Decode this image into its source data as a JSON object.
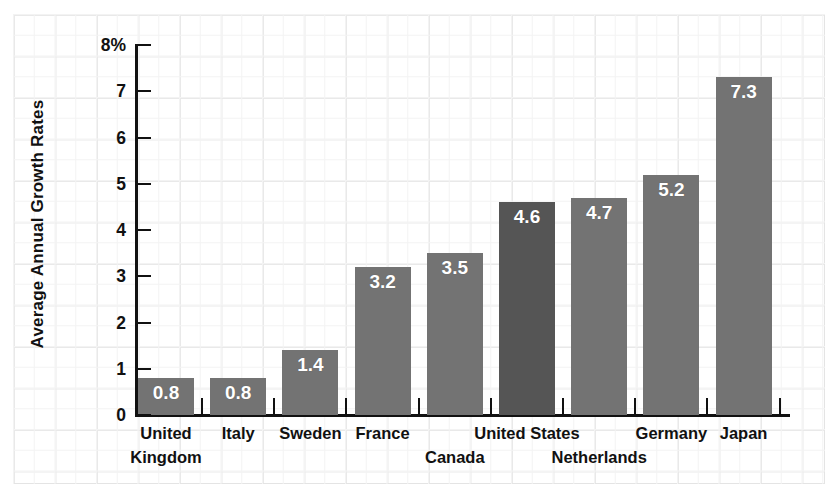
{
  "chart_data": {
    "type": "bar",
    "title": "",
    "subtitle": "",
    "xlabel": "",
    "ylabel": "Average Annual Growth Rates",
    "ylim": [
      0,
      8
    ],
    "yticks": [
      "0",
      "1",
      "2",
      "3",
      "4",
      "5",
      "6",
      "7",
      "8%"
    ],
    "ytick_values": [
      0,
      1,
      2,
      3,
      4,
      5,
      6,
      7,
      8
    ],
    "grid": true,
    "grid_style": "graph-paper",
    "legend": "none",
    "categories": [
      "United Kingdom",
      "Italy",
      "Sweden",
      "France",
      "Canada",
      "United States",
      "Netherlands",
      "Germany",
      "Japan"
    ],
    "values": [
      0.8,
      0.8,
      1.4,
      3.2,
      3.5,
      4.6,
      4.7,
      5.2,
      7.3
    ],
    "value_labels": [
      "0.8",
      "0.8",
      "1.4",
      "3.2",
      "3.5",
      "4.6",
      "4.7",
      "5.2",
      "7.3"
    ],
    "label_rows": [
      0,
      0,
      0,
      0,
      1,
      0,
      1,
      0,
      0
    ],
    "label_lines": [
      [
        "United",
        "Kingdom"
      ],
      [
        "Italy"
      ],
      [
        "Sweden"
      ],
      [
        "France"
      ],
      [
        "Canada"
      ],
      [
        "United States"
      ],
      [
        "Netherlands"
      ],
      [
        "Germany"
      ],
      [
        "Japan"
      ]
    ],
    "highlight_index": 5,
    "colors": {
      "bar": "#737373",
      "bar_highlight": "#555555",
      "value_label": "#ffffff",
      "axis": "#111111",
      "text": "#111111",
      "background": "#ffffff",
      "grid_major": "#e9e9e9",
      "grid_minor": "#f3f3f3"
    }
  }
}
